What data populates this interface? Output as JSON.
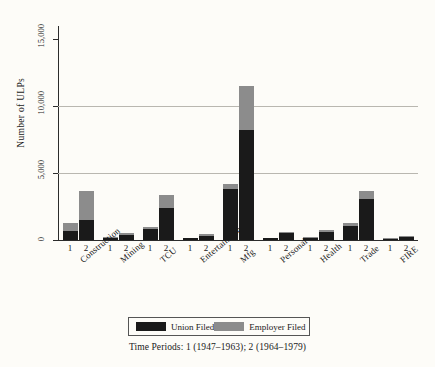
{
  "chart_data": {
    "type": "bar",
    "stacked": true,
    "title": "",
    "xlabel": "",
    "ylabel": "Number of ULPs",
    "ylim": [
      0,
      16000
    ],
    "yticks": [
      0,
      5000,
      10000,
      15000
    ],
    "ytick_labels": [
      "0",
      "5,000",
      "10,000",
      "15,000"
    ],
    "gridlines": [
      5000,
      10000
    ],
    "grid": true,
    "legend_position": "bottom",
    "categories": [
      "Construction",
      "Mining",
      "TCU",
      "Entertainment",
      "Mfg",
      "Personal",
      "Health",
      "Trade",
      "FIRE"
    ],
    "period_labels": [
      "1",
      "2"
    ],
    "series": [
      {
        "name": "Union Filed",
        "color": "#1a1a1a",
        "values_period1": [
          700,
          180,
          800,
          120,
          3800,
          120,
          150,
          1050,
          90
        ],
        "values_period2": [
          1500,
          380,
          2400,
          330,
          8200,
          500,
          620,
          3050,
          260
        ]
      },
      {
        "name": "Employer Filed",
        "color": "#8c8c8c",
        "values_period1": [
          600,
          40,
          200,
          30,
          400,
          30,
          40,
          250,
          30
        ],
        "values_period2": [
          2200,
          110,
          1000,
          90,
          3300,
          130,
          150,
          650,
          60
        ]
      }
    ],
    "annotations": [
      "Time Periods: 1 (1947–1963); 2 (1964–1979)"
    ]
  },
  "legend": {
    "entries": [
      {
        "label": "Union Filed",
        "color": "#1a1a1a"
      },
      {
        "label": "Employer Filed",
        "color": "#8c8c8c"
      }
    ]
  },
  "caption": "Time Periods: 1 (1947–1963); 2 (1964–1979)"
}
